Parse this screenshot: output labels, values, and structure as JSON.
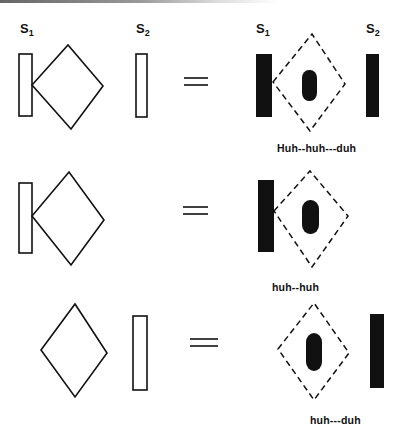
{
  "labels": {
    "s1_left": {
      "base": "S",
      "sub": "1"
    },
    "s2_left": {
      "base": "S",
      "sub": "2"
    },
    "s1_right": {
      "base": "S",
      "sub": "1"
    },
    "s2_right": {
      "base": "S",
      "sub": "2"
    }
  },
  "rows": [
    {
      "left": "S1 bar + diamond touching S1, S2 bar",
      "operator": "=",
      "right": "S1 filled bar, dashed diamond with filled center, S2 filled bar",
      "caption": "Huh--huh---duh"
    },
    {
      "left": "S1 bar + diamond touching S1",
      "operator": "=",
      "right": "S1 filled bar, dashed diamond with filled center",
      "caption": "huh--huh"
    },
    {
      "left": "diamond, S2 bar",
      "operator": "=",
      "right": "dashed diamond with filled center, S2 filled bar",
      "caption": "huh---duh"
    }
  ],
  "colors": {
    "ink": "#111111",
    "background": "#ffffff"
  }
}
